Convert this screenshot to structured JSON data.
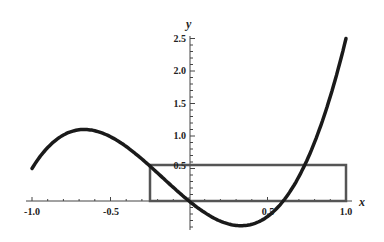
{
  "chart_data": {
    "type": "line",
    "title": "",
    "xlabel": "x",
    "ylabel": "y",
    "xlim": [
      -1.0,
      1.0
    ],
    "ylim": [
      -0.4,
      2.5
    ],
    "x_ticks": [
      "-1.0",
      "-0.5",
      "0.5",
      "1.0"
    ],
    "y_ticks": [
      "0.5",
      "1.0",
      "1.5",
      "2.0",
      "2.5"
    ],
    "grid": false,
    "series": [
      {
        "name": "f(x)",
        "description": "cubic-like curve",
        "x": [
          -1.0,
          -0.8,
          -0.65,
          -0.5,
          -0.25,
          0.0,
          0.33,
          0.61,
          0.75,
          0.9,
          1.0
        ],
        "values": [
          0.5,
          1.02,
          1.1,
          0.98,
          0.54,
          0.0,
          -0.38,
          0.0,
          0.55,
          1.6,
          2.5
        ]
      }
    ],
    "annotations": [
      {
        "type": "rectangle",
        "x0": -0.25,
        "x1": 1.0,
        "y0": 0.0,
        "y1": 0.55,
        "description": "average value rectangle"
      }
    ]
  },
  "labels": {
    "x_axis": "x",
    "y_axis": "y",
    "xticks": {
      "m1": "-1.0",
      "m05": "-0.5",
      "p05": "0.5",
      "p1": "1.0"
    },
    "yticks": {
      "a": "0.5",
      "b": "1.0",
      "c": "1.5",
      "d": "2.0",
      "e": "2.5"
    }
  }
}
